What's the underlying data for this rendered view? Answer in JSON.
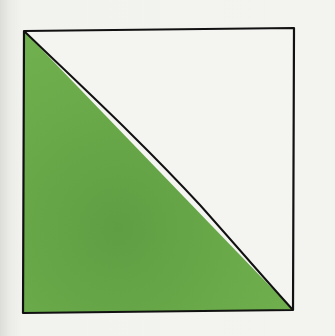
{
  "illustration": {
    "description": "Square divided diagonally; lower-left triangle filled green",
    "colors": {
      "paper": "#f2f2ee",
      "fill": "#6aaa4a",
      "fill_dark": "#5e9c42",
      "ink": "#111111",
      "square_interior": "#f4f4f1"
    },
    "square": {
      "top_left": [
        24,
        31
      ],
      "top_right": [
        294,
        28
      ],
      "bottom_right": [
        293,
        310
      ],
      "bottom_left": [
        23,
        313
      ]
    },
    "triangle": {
      "vertices": [
        [
          24,
          31
        ],
        [
          293,
          310
        ],
        [
          23,
          313
        ]
      ]
    }
  }
}
